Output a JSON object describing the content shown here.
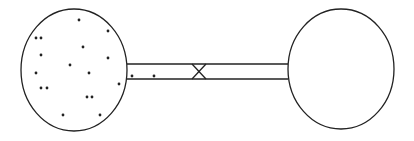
{
  "diagram": {
    "stroke_color": "#222222",
    "background": "#ffffff",
    "left_flask": {
      "cx": 74,
      "cy": 70,
      "rx": 53,
      "ry": 61,
      "particles": [
        [
          79,
          20
        ],
        [
          36,
          38
        ],
        [
          41,
          38
        ],
        [
          108,
          31
        ],
        [
          83,
          47
        ],
        [
          41,
          55
        ],
        [
          108,
          58
        ],
        [
          70,
          65
        ],
        [
          36,
          73
        ],
        [
          89,
          73
        ],
        [
          41,
          88
        ],
        [
          47,
          88
        ],
        [
          119,
          84
        ],
        [
          87,
          97
        ],
        [
          92,
          97
        ],
        [
          63,
          115
        ],
        [
          100,
          115
        ]
      ]
    },
    "right_flask": {
      "cx": 341,
      "cy": 69,
      "rx": 53,
      "ry": 60,
      "particles": []
    },
    "tube": {
      "x1": 127,
      "x2": 288,
      "top_y": 64,
      "bottom_y": 79,
      "particles": [
        [
          132,
          76
        ],
        [
          154,
          76
        ]
      ]
    },
    "valve": {
      "x1": 192,
      "x2": 206,
      "top_y": 64,
      "bottom_y": 79,
      "icon": "stopcock-bowtie-icon"
    }
  }
}
